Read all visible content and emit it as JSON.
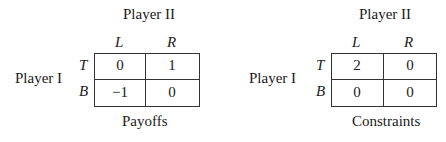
{
  "games": [
    {
      "column_player": "Player II",
      "row_player": "Player I",
      "columns": [
        "L",
        "R"
      ],
      "rows": [
        "T",
        "B"
      ],
      "cells": [
        [
          "0",
          "1"
        ],
        [
          "−1",
          "0"
        ]
      ],
      "caption": "Payoffs"
    },
    {
      "column_player": "Player II",
      "row_player": "Player I",
      "columns": [
        "L",
        "R"
      ],
      "rows": [
        "T",
        "B"
      ],
      "cells": [
        [
          "2",
          "0"
        ],
        [
          "0",
          "0"
        ]
      ],
      "caption": "Constraints"
    }
  ]
}
